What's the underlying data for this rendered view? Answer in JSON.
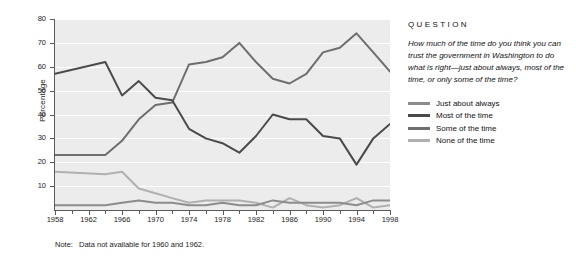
{
  "side": {
    "question_heading": "QUESTION",
    "question_text": "How much of the time do you think you can trust the government in Washington to do what is right—just about always, most of the time, or only some of the time?"
  },
  "note": {
    "label": "Note:",
    "text": "Data not available for 1960 and 1962."
  },
  "colors": {
    "just_about_always": "#8c8c8c",
    "most_of_the_time": "#4a4a4a",
    "some_of_the_time": "#6e6e6e",
    "none_of_the_time": "#b0b0b0",
    "plot_background": "#ececec",
    "gridline": "#ffffff",
    "axis": "#5a5a5a"
  },
  "chart_data": {
    "type": "line",
    "title": "",
    "xlabel": "",
    "ylabel": "Percentage",
    "ylim": [
      0,
      80
    ],
    "xlim": [
      1958,
      1998
    ],
    "ytick_values": [
      0,
      10,
      20,
      30,
      40,
      50,
      60,
      70,
      80
    ],
    "ytick_labels": [
      "",
      "10",
      "20",
      "30",
      "40",
      "50",
      "60",
      "70",
      "80"
    ],
    "xtick_labels": [
      "1958",
      "1962",
      "1966",
      "1970",
      "1974",
      "1978",
      "1982",
      "1986",
      "1990",
      "1994",
      "1998"
    ],
    "xtick_values": [
      1958,
      1962,
      1966,
      1970,
      1974,
      1978,
      1982,
      1986,
      1990,
      1994,
      1998
    ],
    "xminor_values": [
      1960,
      1964,
      1968,
      1972,
      1976,
      1980,
      1984,
      1988,
      1992,
      1996
    ],
    "grid": true,
    "legend_position": "right",
    "x": [
      1958,
      1964,
      1966,
      1968,
      1970,
      1972,
      1974,
      1976,
      1978,
      1980,
      1982,
      1984,
      1986,
      1988,
      1990,
      1992,
      1994,
      1996,
      1998
    ],
    "series": [
      {
        "name": "Just about always",
        "color": "#8c8c8c",
        "values": [
          2,
          2,
          3,
          4,
          3,
          3,
          2,
          2,
          3,
          2,
          2,
          4,
          3,
          3,
          3,
          3,
          2,
          4,
          4
        ]
      },
      {
        "name": "Most of the time",
        "color": "#4a4a4a",
        "values": [
          57,
          62,
          48,
          54,
          47,
          46,
          34,
          30,
          28,
          24,
          31,
          40,
          38,
          38,
          31,
          30,
          19,
          30,
          36
        ]
      },
      {
        "name": "Some of the time",
        "color": "#6e6e6e",
        "values": [
          23,
          23,
          29,
          38,
          44,
          45,
          61,
          62,
          64,
          70,
          62,
          55,
          53,
          57,
          66,
          68,
          74,
          66,
          58
        ]
      },
      {
        "name": "None of the time",
        "color": "#b0b0b0",
        "values": [
          16,
          15,
          16,
          9,
          7,
          5,
          3,
          4,
          4,
          4,
          3,
          1,
          5,
          2,
          1,
          2,
          5,
          1,
          2
        ]
      }
    ]
  }
}
